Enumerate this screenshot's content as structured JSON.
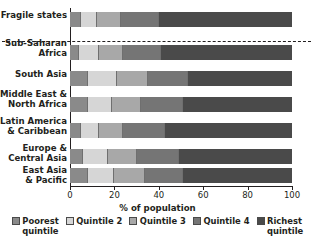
{
  "chart_data": {
    "type": "bar",
    "orientation": "horizontal",
    "stacked": true,
    "title": "",
    "xlabel": "% of population",
    "ylabel": "",
    "xlim": [
      0,
      100
    ],
    "xticks": [
      0,
      20,
      40,
      60,
      80,
      100
    ],
    "xtick_labels": [
      "0",
      "20",
      "40",
      "60",
      "80",
      "100"
    ],
    "grid": false,
    "legend_position": "bottom",
    "categories": [
      "Fragile states",
      "Sub-Saharan\nAfrica",
      "South Asia",
      "Middle East &\nNorth Africa",
      "Latin America\n& Caribbean",
      "Europe &\nCentral Asia",
      "East Asia\n& Pacific"
    ],
    "series": [
      {
        "name": "Poorest\nquintile",
        "color": "#8a8a8a",
        "values": [
          5,
          4,
          8,
          8,
          5,
          6,
          8
        ]
      },
      {
        "name": "Quintile 2",
        "color": "#d6d6d6",
        "values": [
          7,
          9,
          13,
          11,
          8,
          11,
          12
        ]
      },
      {
        "name": "Quintile 3",
        "color": "#a8a8a8",
        "values": [
          11,
          11,
          14,
          13,
          11,
          13,
          14
        ]
      },
      {
        "name": "Quintile 4",
        "color": "#757575",
        "values": [
          17,
          17,
          18,
          19,
          19,
          19,
          17
        ]
      },
      {
        "name": "Richest\nquintile",
        "color": "#4a4a4a",
        "values": [
          60,
          59,
          47,
          49,
          57,
          51,
          49
        ]
      }
    ]
  },
  "legend": {
    "items": [
      {
        "label": "Poorest\nquintile"
      },
      {
        "label": "Quintile 2"
      },
      {
        "label": "Quintile 3"
      },
      {
        "label": "Quintile 4"
      },
      {
        "label": "Richest\nquintile"
      }
    ]
  },
  "axis": {
    "x_title": "% of population"
  }
}
